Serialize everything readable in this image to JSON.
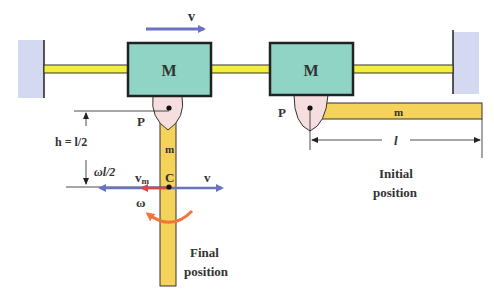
{
  "diagram": {
    "colors": {
      "wall": "#d4d8f0",
      "rail": "#f4ee3c",
      "block": "#8fd4c4",
      "pivot": "#f7dede",
      "rod": "#f5d25a",
      "velocity_arrow": "#6a72c4",
      "vm_arrow": "#d9464a",
      "omega_arrow": "#f0773a",
      "outline": "#222222"
    },
    "labels": {
      "velocity_top": "v",
      "block_left": "M",
      "block_right": "M",
      "pivot_left": "P",
      "pivot_right": "P",
      "rod_initial": "m",
      "rod_final": "m",
      "length": "l",
      "height": "h = l/2",
      "omega_l_half": "ωl/2",
      "center": "C",
      "vm": "v",
      "vm_sub": "m",
      "v_right": "v",
      "omega": "ω",
      "final_position_1": "Final",
      "final_position_2": "position",
      "initial_position_1": "Initial",
      "initial_position_2": "position"
    }
  }
}
